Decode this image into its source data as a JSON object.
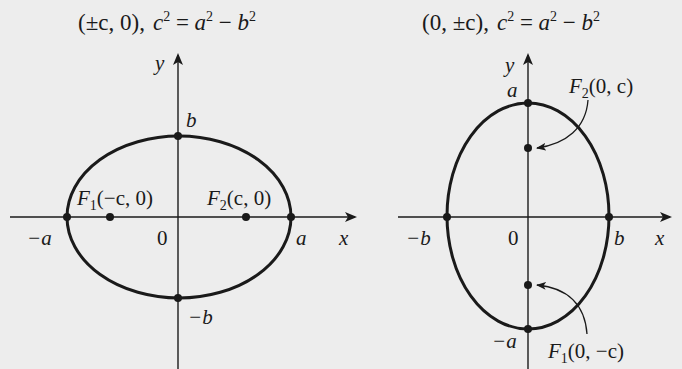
{
  "colors": {
    "background": "#ededed",
    "ink": "#1a1a1a"
  },
  "left_diagram": {
    "caption": {
      "foci": "(±c, 0),",
      "relation_c": "c",
      "relation_exp1": "2",
      "relation_eq": " = ",
      "relation_a": "a",
      "relation_exp2": "2",
      "relation_minus": " − ",
      "relation_b": "b",
      "relation_exp3": "2"
    },
    "axis_labels": {
      "x": "x",
      "y": "y",
      "origin": "0"
    },
    "vertex_labels": {
      "pos_a": "a",
      "neg_a": "−a",
      "pos_b": "b",
      "neg_b": "−b"
    },
    "focus_labels": {
      "f1_name": "F",
      "f1_sub": "1",
      "f1_coords": "(−c, 0)",
      "f2_name": "F",
      "f2_sub": "2",
      "f2_coords": "(c, 0)"
    },
    "orientation": "horizontal major axis"
  },
  "right_diagram": {
    "caption": {
      "foci": "(0, ±c),",
      "relation_c": "c",
      "relation_exp1": "2",
      "relation_eq": " = ",
      "relation_a": "a",
      "relation_exp2": "2",
      "relation_minus": " − ",
      "relation_b": "b",
      "relation_exp3": "2"
    },
    "axis_labels": {
      "x": "x",
      "y": "y",
      "origin": "0"
    },
    "vertex_labels": {
      "pos_a": "a",
      "neg_a": "−a",
      "pos_b": "b",
      "neg_b": "−b"
    },
    "focus_labels": {
      "f1_name": "F",
      "f1_sub": "1",
      "f1_coords": "(0, −c)",
      "f2_name": "F",
      "f2_sub": "2",
      "f2_coords": "(0, c)"
    },
    "orientation": "vertical major axis"
  }
}
